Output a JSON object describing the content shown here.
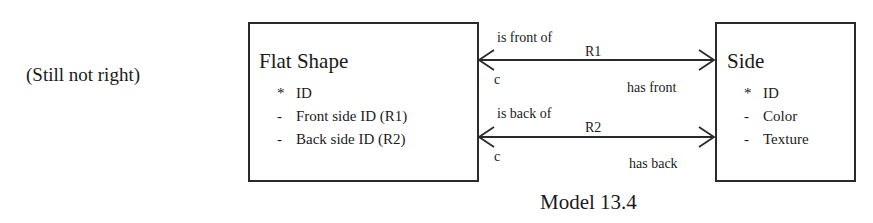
{
  "note": "(Still not right)",
  "entities": {
    "flat_shape": {
      "title": "Flat Shape",
      "attributes": [
        {
          "mark": "*",
          "label": "ID"
        },
        {
          "mark": "-",
          "label": "Front side ID (R1)"
        },
        {
          "mark": "-",
          "label": "Back side ID (R2)"
        }
      ]
    },
    "side": {
      "title": "Side",
      "attributes": [
        {
          "mark": "*",
          "label": "ID"
        },
        {
          "mark": "-",
          "label": "Color"
        },
        {
          "mark": "-",
          "label": "Texture"
        }
      ]
    }
  },
  "relationships": [
    {
      "id": "R1",
      "left_phrase": "is front of",
      "left_cardinality": "c",
      "right_phrase": "has front"
    },
    {
      "id": "R2",
      "left_phrase": "is back of",
      "left_cardinality": "c",
      "right_phrase": "has back"
    }
  ],
  "caption": "Model 13.4",
  "colors": {
    "line": "#2a2a2a",
    "text": "#1a1a1a",
    "background": "#ffffff"
  }
}
